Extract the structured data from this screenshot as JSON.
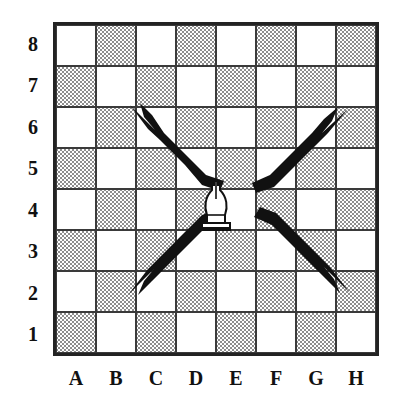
{
  "diagram": {
    "board": {
      "files": [
        "A",
        "B",
        "C",
        "D",
        "E",
        "F",
        "G",
        "H"
      ],
      "ranks": [
        "8",
        "7",
        "6",
        "5",
        "4",
        "3",
        "2",
        "1"
      ],
      "light_square_color": "#ffffff",
      "dark_square_color": "#b9b9b9",
      "grid_line_color": "#3a3a3a",
      "border_color": "#232323",
      "background_color": "#ffffff"
    },
    "pieces": [
      {
        "name": "bishop",
        "color": "white",
        "square": "E4",
        "file": "E",
        "rank": "4",
        "glyph": "bishop-icon"
      }
    ],
    "arrows": [
      {
        "name": "arrow-up-left",
        "from_square": "E4",
        "to_square": "A8",
        "direction": "up-left",
        "color": "#111111"
      },
      {
        "name": "arrow-up-right",
        "from_square": "E4",
        "to_square": "H7",
        "direction": "up-right",
        "color": "#111111"
      },
      {
        "name": "arrow-down-left",
        "from_square": "E4",
        "to_square": "B1",
        "direction": "down-left",
        "color": "#111111"
      },
      {
        "name": "arrow-down-right",
        "from_square": "E4",
        "to_square": "H1",
        "direction": "down-right",
        "color": "#111111"
      }
    ]
  },
  "chart_data": {
    "type": "diagram",
    "categories": [
      "A",
      "B",
      "C",
      "D",
      "E",
      "F",
      "G",
      "H"
    ],
    "rows": [
      "8",
      "7",
      "6",
      "5",
      "4",
      "3",
      "2",
      "1"
    ],
    "piece_square": "E4",
    "move_targets": [
      "A8",
      "H7",
      "B1",
      "H1"
    ]
  }
}
